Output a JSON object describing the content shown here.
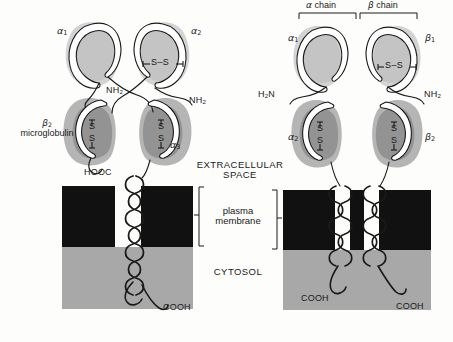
{
  "figure": {
    "title_visible": false,
    "colors": {
      "background": "#fdfdfc",
      "membrane": "#111111",
      "cytosol": "#a8a8a8",
      "domain_light": "#c9c9c9",
      "domain_light_halo": "#d8d8d8",
      "domain_dark": "#9a9a9a",
      "domain_dark_halo": "#b5b5b5",
      "chain_outline": "#1a1a1a",
      "chain_fill": "#ffffff",
      "text": "#1a1a1a"
    }
  },
  "regions": {
    "extracellular": "EXTRACELLULAR\nSPACE",
    "extracellular_line1": "EXTRACELLULAR",
    "extracellular_line2": "SPACE",
    "membrane_line1": "plasma",
    "membrane_line2": "membrane",
    "cytosol": "CYTOSOL"
  },
  "left_molecule": {
    "name": "MHC class I molecule",
    "domains": [
      {
        "id": "a1",
        "label": "α",
        "subscript": "1",
        "shade": "light"
      },
      {
        "id": "a2",
        "label": "α",
        "subscript": "2",
        "shade": "light"
      },
      {
        "id": "a3",
        "label": "α",
        "subscript": "3",
        "shade": "dark"
      },
      {
        "id": "b2m",
        "label": "β",
        "subscript": "2",
        "shade": "dark"
      }
    ],
    "b2m_label_line1": "β",
    "b2m_label_sub": "2",
    "b2m_label_line2": "microglobulin",
    "termini": [
      {
        "id": "nh2-inner",
        "text": "NH",
        "subscript": "2"
      },
      {
        "id": "nh2-outer",
        "text": "NH",
        "subscript": "2"
      },
      {
        "id": "hooc",
        "text": "HOOC",
        "subscript": ""
      },
      {
        "id": "cooh",
        "text": "COOH",
        "subscript": ""
      }
    ],
    "disulfides": [
      {
        "id": "ss-top",
        "text": "S–S",
        "orientation": "horizontal"
      },
      {
        "id": "ss-b2m",
        "text": "S",
        "text2": "S",
        "orientation": "vertical"
      },
      {
        "id": "ss-a3",
        "text": "S",
        "text2": "S",
        "orientation": "vertical"
      }
    ]
  },
  "right_molecule": {
    "name": "MHC class II molecule",
    "chain_brackets": [
      {
        "id": "alpha-chain",
        "label": "α chain"
      },
      {
        "id": "beta-chain",
        "label": "β chain"
      }
    ],
    "domains": [
      {
        "id": "a1",
        "label": "α",
        "subscript": "1",
        "shade": "light"
      },
      {
        "id": "b1",
        "label": "β",
        "subscript": "1",
        "shade": "light"
      },
      {
        "id": "a2",
        "label": "α",
        "subscript": "2",
        "shade": "dark"
      },
      {
        "id": "b2",
        "label": "β",
        "subscript": "2",
        "shade": "dark"
      }
    ],
    "termini": [
      {
        "id": "h2n",
        "text": "H",
        "subscript": "2",
        "text_after": "N"
      },
      {
        "id": "nh2",
        "text": "NH",
        "subscript": "2"
      },
      {
        "id": "cooh-alpha",
        "text": "COOH",
        "subscript": ""
      },
      {
        "id": "cooh-beta",
        "text": "COOH",
        "subscript": ""
      }
    ],
    "disulfides": [
      {
        "id": "ss-top",
        "text": "S–S",
        "orientation": "horizontal"
      },
      {
        "id": "ss-a2",
        "text": "S",
        "text2": "S",
        "orientation": "vertical"
      },
      {
        "id": "ss-b2",
        "text": "S",
        "text2": "S",
        "orientation": "vertical"
      }
    ]
  }
}
